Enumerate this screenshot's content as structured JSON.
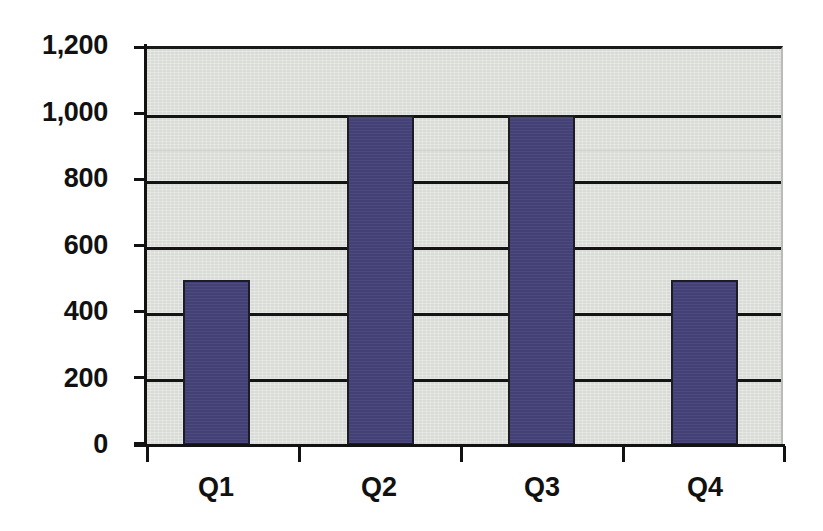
{
  "chart_data": {
    "type": "bar",
    "title": "",
    "subtitle": "",
    "xlabel": "",
    "ylabel": "",
    "categories": [
      "Q1",
      "Q2",
      "Q3",
      "Q4"
    ],
    "values": [
      500,
      1000,
      1000,
      500
    ],
    "series": [
      {
        "name": "Series 1",
        "values": [
          500,
          1000,
          1000,
          500
        ],
        "color": "#454279"
      }
    ],
    "ylim": [
      0,
      1200
    ],
    "ytick_step": 200,
    "ytick_labels": [
      "1,200",
      "1,000",
      "800",
      "600",
      "400",
      "200",
      "0"
    ],
    "ytick_values": [
      1200,
      1000,
      800,
      600,
      400,
      200,
      0
    ],
    "grid": true,
    "grid_axis": "y",
    "legend": false,
    "legend_position": "none",
    "plot_background_color": "#dcdfda",
    "axis_color": "#121212",
    "gridline_color": "#141414",
    "label_color": "#111111",
    "bar_fill_color": "#454279",
    "bar_border_color": "#1c1c22",
    "annotations": []
  }
}
